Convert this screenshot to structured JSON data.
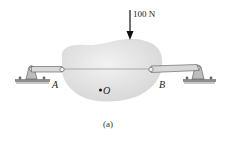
{
  "figure": {
    "caption": "(a)",
    "force_label": "100 N",
    "point_a": "A",
    "point_b": "B",
    "point_o": "O"
  },
  "colors": {
    "body": "#e6e6e6",
    "link": "#d4d4d4",
    "link_stroke": "#555555",
    "ground": "#9a9a9a",
    "arrow": "#111111"
  }
}
